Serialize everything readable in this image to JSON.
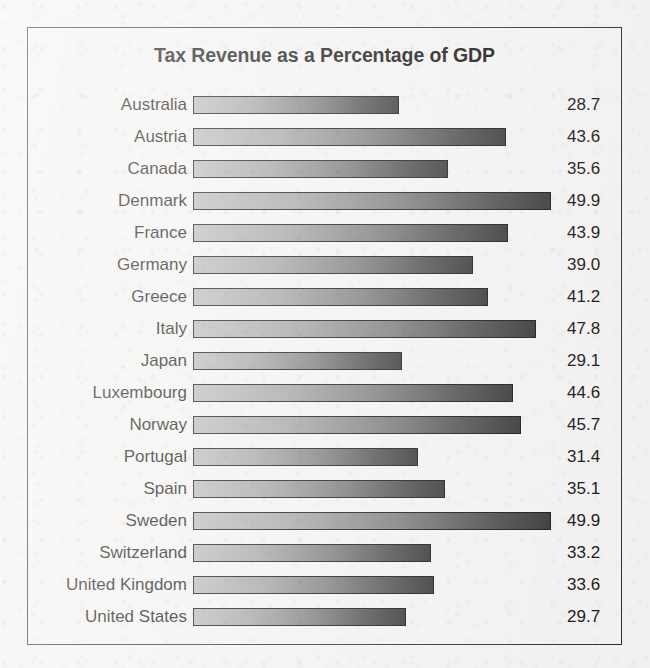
{
  "chart_data": {
    "type": "bar",
    "orientation": "horizontal",
    "title": "Tax Revenue as a Percentage of GDP",
    "xlabel": "",
    "ylabel": "",
    "xlim": [
      0,
      52
    ],
    "grid": false,
    "legend": false,
    "value_labels": true,
    "categories": [
      "Australia",
      "Austria",
      "Canada",
      "Denmark",
      "France",
      "Germany",
      "Greece",
      "Italy",
      "Japan",
      "Luxembourg",
      "Norway",
      "Portugal",
      "Spain",
      "Sweden",
      "Switzerland",
      "United Kingdom",
      "United States"
    ],
    "values": [
      28.7,
      43.6,
      35.6,
      49.9,
      43.9,
      39.0,
      41.2,
      47.8,
      29.1,
      44.6,
      45.7,
      31.4,
      35.1,
      49.9,
      33.2,
      33.6,
      29.7
    ],
    "value_text": [
      "28.7",
      "43.6",
      "35.6",
      "49.9",
      "43.9",
      "39.0",
      "41.2",
      "47.8",
      "29.1",
      "44.6",
      "45.7",
      "31.4",
      "35.1",
      "49.9",
      "33.2",
      "33.6",
      "29.7"
    ],
    "rows": [
      {
        "label": "Australia",
        "value": 28.7,
        "value_text": "28.7"
      },
      {
        "label": "Austria",
        "value": 43.6,
        "value_text": "43.6"
      },
      {
        "label": "Canada",
        "value": 35.6,
        "value_text": "35.6"
      },
      {
        "label": "Denmark",
        "value": 49.9,
        "value_text": "49.9"
      },
      {
        "label": "France",
        "value": 43.9,
        "value_text": "43.9"
      },
      {
        "label": "Germany",
        "value": 39.0,
        "value_text": "39.0"
      },
      {
        "label": "Greece",
        "value": 41.2,
        "value_text": "41.2"
      },
      {
        "label": "Italy",
        "value": 47.8,
        "value_text": "47.8"
      },
      {
        "label": "Japan",
        "value": 29.1,
        "value_text": "29.1"
      },
      {
        "label": "Luxembourg",
        "value": 44.6,
        "value_text": "44.6"
      },
      {
        "label": "Norway",
        "value": 45.7,
        "value_text": "45.7"
      },
      {
        "label": "Portugal",
        "value": 31.4,
        "value_text": "31.4"
      },
      {
        "label": "Spain",
        "value": 35.1,
        "value_text": "35.1"
      },
      {
        "label": "Sweden",
        "value": 49.9,
        "value_text": "49.9"
      },
      {
        "label": "Switzerland",
        "value": 33.2,
        "value_text": "33.2"
      },
      {
        "label": "United Kingdom",
        "value": 33.6,
        "value_text": "33.6"
      },
      {
        "label": "United States",
        "value": 29.7,
        "value_text": "29.7"
      }
    ]
  },
  "style": {
    "background": "#f4f3f1",
    "frame_color": "#2b2b2b",
    "text_color": "#111111",
    "bar_gradient_start": "#b9b9b9",
    "bar_gradient_end": "#333333",
    "bar_outline": "#111111",
    "pixels_per_unit": 7.17
  }
}
